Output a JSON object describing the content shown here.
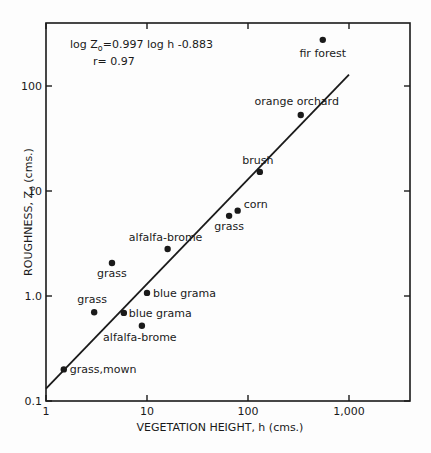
{
  "chart_data": {
    "type": "scatter",
    "title": "",
    "xlabel": "VEGETATION HEIGHT, h (cms.)",
    "ylabel": "ROUGHNESS, Zo (cms.)",
    "xscale": "log",
    "yscale": "log",
    "xlim": [
      1,
      4000
    ],
    "ylim": [
      0.1,
      390
    ],
    "xticks": [
      1,
      10,
      100,
      1000
    ],
    "xtick_labels": [
      "1",
      "10",
      "100",
      "1,000"
    ],
    "yticks": [
      0.1,
      1.0,
      10,
      100
    ],
    "ytick_labels": [
      "0.1",
      "1.0",
      "10",
      "100"
    ],
    "grid": false,
    "annotations": {
      "equation": "log Zo=0.997 log h -0.883",
      "equation_parts": {
        "lhs": "log Z",
        "sub": "o",
        "rhs": "=0.997 log h -0.883"
      },
      "r": "r= 0.97"
    },
    "fit_line": {
      "slope": 0.997,
      "intercept": -0.883,
      "x_start": 1,
      "x_end": 1000
    },
    "points": [
      {
        "label": "grass,mown",
        "x": 1.5,
        "y": 0.2
      },
      {
        "label": "grass",
        "x": 3.0,
        "y": 0.7
      },
      {
        "label": "blue grama",
        "x": 5.9,
        "y": 0.69
      },
      {
        "label": "alfalfa-brome",
        "x": 8.9,
        "y": 0.52
      },
      {
        "label": "blue grama",
        "x": 10,
        "y": 1.07
      },
      {
        "label": "grass",
        "x": 4.5,
        "y": 2.06
      },
      {
        "label": "alfalfa-brome",
        "x": 16,
        "y": 2.8
      },
      {
        "label": "grass",
        "x": 65,
        "y": 5.8
      },
      {
        "label": "corn",
        "x": 79,
        "y": 6.5
      },
      {
        "label": "brush",
        "x": 131,
        "y": 15.2
      },
      {
        "label": "orange orchard",
        "x": 333,
        "y": 53
      },
      {
        "label": "fir forest",
        "x": 550,
        "y": 275
      }
    ]
  }
}
